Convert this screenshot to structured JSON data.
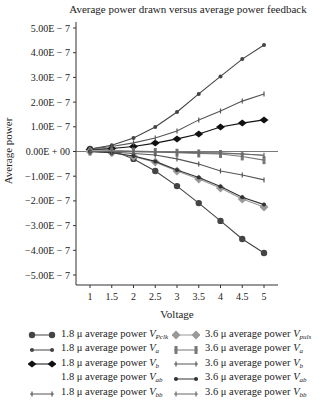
{
  "chart_data": {
    "type": "line",
    "title": "Average power drawn versus average power feedback",
    "xlabel": "Voltage",
    "ylabel": "Average power",
    "x": [
      1,
      1.5,
      2,
      2.5,
      3,
      3.5,
      4,
      4.5,
      5
    ],
    "xticks": [
      "1",
      "1.5",
      "2",
      "2.5",
      "3",
      "3.5",
      "4",
      "4.5",
      "5"
    ],
    "yticks": [
      "5.00E − 7",
      "4.00E − 7",
      "3.00E − 7",
      "2.00E − 7",
      "1.00E − 7",
      "0.00E + 00",
      "−1.00E − 7",
      "−2.00E − 7",
      "−3.00E − 7",
      "−4.00E − 7",
      "−5.00E − 7"
    ],
    "ylim": [
      -5e-07,
      5e-07
    ],
    "xlim": [
      0.7,
      5.3
    ],
    "grid": false,
    "legend_position": "bottom",
    "unit_scale": "1E-7",
    "series": [
      {
        "name": "1.8 μ average power V_Pclk",
        "label": "1.8 μ average power ",
        "var": "V",
        "sub": "Pclk",
        "color": "#444444",
        "marker": "circle",
        "values": [
          0.1,
          0.05,
          -0.3,
          -0.79,
          -1.4,
          -2.09,
          -2.81,
          -3.54,
          -4.11
        ]
      },
      {
        "name": "1.8 μ average power V_a",
        "label": "1.8 μ average power ",
        "var": "V",
        "sub": "a",
        "color": "#444444",
        "marker": "dot",
        "values": [
          0.1,
          0.25,
          0.55,
          0.99,
          1.6,
          2.33,
          3.04,
          3.74,
          4.31
        ]
      },
      {
        "name": "1.8 μ average power V_b",
        "label": "1.8 μ average power ",
        "var": "V",
        "sub": "b",
        "color": "#111111",
        "marker": "diamond",
        "values": [
          0.08,
          0.12,
          0.2,
          0.34,
          0.51,
          0.71,
          0.99,
          1.15,
          1.28
        ]
      },
      {
        "name": "1.8 μ average power V_ab",
        "label": "1.8 μ average power ",
        "var": "V",
        "sub": "ab",
        "color": "#888888",
        "marker": "none",
        "values": [
          0.05,
          0.05,
          0.02,
          0.0,
          -0.02,
          -0.05,
          -0.08,
          -0.1,
          -0.15
        ]
      },
      {
        "name": "1.8 μ average power V_bb",
        "label": "1.8 μ average power ",
        "var": "V",
        "sub": "bb",
        "color": "#555555",
        "marker": "tick",
        "values": [
          0.1,
          0.2,
          0.35,
          0.55,
          0.83,
          1.28,
          1.64,
          2.04,
          2.33
        ]
      },
      {
        "name": "3.6 μ average power V_puls",
        "label": "3.6 μ average power ",
        "var": "V",
        "sub": "puls",
        "color": "#999999",
        "marker": "diamond-lg",
        "values": [
          0.0,
          -0.05,
          -0.2,
          -0.43,
          -0.79,
          -1.11,
          -1.48,
          -1.92,
          -2.25
        ]
      },
      {
        "name": "3.6 μ average power V_a",
        "label": "3.6 μ average power ",
        "var": "V",
        "sub": "a",
        "color": "#777777",
        "marker": "bar",
        "values": [
          0.0,
          0.0,
          0.0,
          -0.02,
          -0.05,
          -0.08,
          -0.1,
          -0.2,
          -0.35
        ]
      },
      {
        "name": "3.6 μ average power V_b",
        "label": "3.6 μ average power ",
        "var": "V",
        "sub": "b",
        "color": "#555555",
        "marker": "tick",
        "values": [
          0.0,
          -0.02,
          -0.08,
          -0.14,
          -0.3,
          -0.51,
          -0.79,
          -0.95,
          -1.15
        ]
      },
      {
        "name": "3.6 μ average power V_ab",
        "label": "3.6 μ average power ",
        "var": "V",
        "sub": "ab",
        "color": "#333333",
        "marker": "dot",
        "values": [
          0.0,
          -0.05,
          -0.18,
          -0.4,
          -0.75,
          -1.05,
          -1.42,
          -1.85,
          -2.15
        ]
      },
      {
        "name": "3.6 μ average power V_bb",
        "label": "3.6 μ average power ",
        "var": "V",
        "sub": "bb",
        "color": "#666666",
        "marker": "tick",
        "values": [
          0.0,
          0.0,
          -0.01,
          -0.02,
          -0.03,
          -0.05,
          -0.05,
          -0.1,
          -0.15
        ]
      }
    ]
  }
}
